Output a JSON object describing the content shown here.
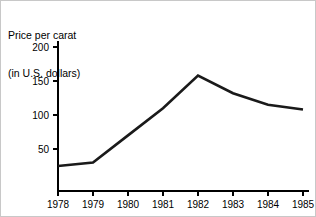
{
  "title": {
    "line1": "Price per carat",
    "line2": "(in U.S. dollars)"
  },
  "chart_data": {
    "type": "line",
    "title": "Price per carat (in U.S. dollars)",
    "xlabel": "",
    "ylabel": "Price per carat (in U.S. dollars)",
    "categories": [
      "1978",
      "1979",
      "1980",
      "1981",
      "1982",
      "1983",
      "1984",
      "1985"
    ],
    "x": [
      1978,
      1979,
      1980,
      1981,
      1982,
      1983,
      1984,
      1985
    ],
    "values": [
      25,
      30,
      70,
      110,
      158,
      132,
      115,
      108
    ],
    "series": [
      {
        "name": "Price per carat",
        "values": [
          25,
          30,
          70,
          110,
          158,
          132,
          115,
          108
        ],
        "color": "#1a1a1a"
      }
    ],
    "ylim": [
      0,
      200
    ],
    "yticks": [
      50,
      100,
      150,
      200
    ],
    "ytick_labels": [
      "50",
      "100",
      "150",
      "200"
    ],
    "xticks": [
      1978,
      1979,
      1980,
      1981,
      1982,
      1983,
      1984,
      1985
    ],
    "xtick_labels": [
      "1978",
      "1979",
      "1980",
      "1981",
      "1982",
      "1983",
      "1984",
      "1985"
    ],
    "grid": false,
    "legend": false,
    "legend_position": "none"
  },
  "colors": {
    "line": "#1a1a1a",
    "axis": "#000000",
    "background": "#ffffff",
    "border": "#c8c8c8"
  }
}
